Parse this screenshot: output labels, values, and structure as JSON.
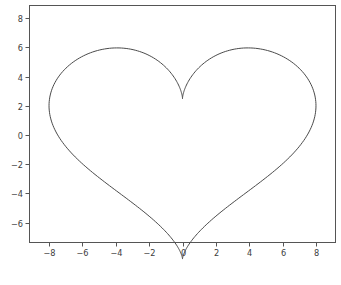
{
  "figure": {
    "background_color": "#ffffff",
    "width": 341,
    "height": 285
  },
  "caption": {
    "text": "",
    "visible": false
  },
  "chart_data": {
    "type": "line",
    "title": "",
    "xlabel": "",
    "ylabel": "",
    "xlim": [
      -9.2,
      9.2
    ],
    "ylim": [
      -7.4,
      8.9
    ],
    "xticks": [
      -8,
      -6,
      -4,
      -2,
      0,
      2,
      4,
      6,
      8
    ],
    "xticklabels": [
      "−8",
      "−6",
      "−4",
      "−2",
      "0",
      "2",
      "4",
      "6",
      "8"
    ],
    "yticks": [
      -6,
      -4,
      -2,
      0,
      2,
      4,
      6,
      8
    ],
    "yticklabels": [
      "−6",
      "−4",
      "−2",
      "0",
      "2",
      "4",
      "6",
      "8"
    ],
    "grid": false,
    "legend": null,
    "series": [
      {
        "name": "heart-curve",
        "color": "#4a4a4a",
        "linewidth": 1.0,
        "closed": true,
        "equation_x": "x = 8*sin(t)^3",
        "equation_y": "y = 6.5*cos(t) - 2.5*cos(2t) - cos(3t) - 0.5*cos(4t)",
        "t_range": [
          0,
          6.283185307179586
        ],
        "n_points": 400,
        "annotations": {
          "top_cusp": {
            "x": 0,
            "y": 6.4
          },
          "bottom_tip": {
            "x": 0,
            "y": -6.4
          },
          "left_lobe_peak": {
            "x": -5.0,
            "y": 8.1
          },
          "right_lobe_peak": {
            "x": 5.0,
            "y": 8.1
          },
          "leftmost": {
            "x": -8.1,
            "y": 5.0
          },
          "rightmost": {
            "x": 8.1,
            "y": 5.0
          }
        }
      }
    ]
  },
  "axes": {
    "spine_color": "#555555",
    "tick_color": "#555555",
    "tick_label_color": "#3c3c3c",
    "plot_area": {
      "left": 29,
      "top": 5,
      "right": 336,
      "bottom": 243
    }
  }
}
